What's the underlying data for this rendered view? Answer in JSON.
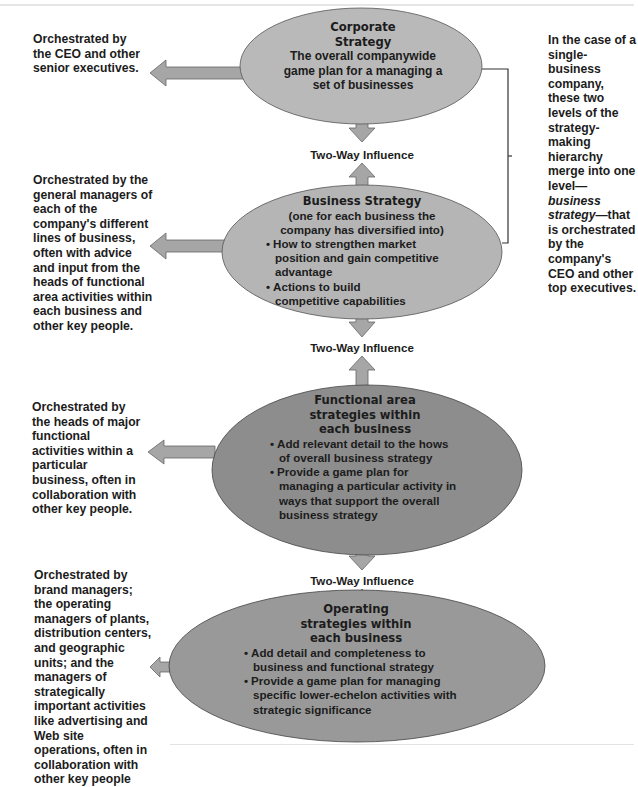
{
  "colors": {
    "corporate_fill": "#b9b9b9",
    "business_fill": "#b5b5b5",
    "functional_fill": "#8d8d8d",
    "operating_fill": "#999999",
    "arrow_fill": "#a6a6a6",
    "outline": "#555555"
  },
  "levels": [
    {
      "title": "Corporate Strategy",
      "title_lines": [
        "Corporate",
        "Strategy"
      ],
      "subtitle": "The overall companywide game plan for a managing a set of businesses",
      "bullets": [],
      "orchestrated_by": "Orchestrated by the CEO and other senior executives."
    },
    {
      "title": "Business Strategy",
      "title_lines": [
        "Business Strategy"
      ],
      "subtitle": "(one for each business the company has diversified into)",
      "bullets": [
        "How to strengthen market position and gain competitive advantage",
        "Actions to build competitive capabilities"
      ],
      "orchestrated_by": "Orchestrated by the general managers of each of the company's different lines of business, often with advice and input from the heads of functional area activities within each business and other key people."
    },
    {
      "title": "Functional area strategies within each business",
      "title_lines": [
        "Functional area",
        "strategies within",
        "each business"
      ],
      "subtitle": "",
      "bullets": [
        "Add relevant detail to the hows of overall business strategy",
        "Provide a game plan for managing a particular activity in ways that support the overall business strategy"
      ],
      "orchestrated_by": "Orchestrated by the heads of major functional activities within a particular business, often in collaboration with other key people."
    },
    {
      "title": "Operating strategies within each business",
      "title_lines": [
        "Operating",
        "strategies within",
        "each business"
      ],
      "subtitle": "",
      "bullets": [
        "Add detail and completeness to business and functional strategy",
        "Provide a game plan for managing specific lower-echelon activities with strategic significance"
      ],
      "orchestrated_by": "Orchestrated by brand managers; the operating managers of plants, distribution centers, and geographic units; and the managers of strategically important activities like advertising and Web site operations, often in collaboration with other key people"
    }
  ],
  "influence_labels": [
    "Two-Way Influence",
    "Two-Way Influence",
    "Two-Way Influence"
  ],
  "single_business_note": {
    "before": "In the case of a single-business company, these two levels of the strategy-making hierarchy merge into one level—",
    "emphasis": "business strategy",
    "after": "—that is orchestrated by the company's CEO and other top executives."
  }
}
